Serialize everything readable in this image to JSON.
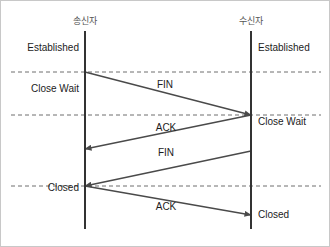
{
  "diagram": {
    "title_left": "송신자",
    "title_right": "수신자",
    "frame": {
      "width": 330,
      "height": 247,
      "background": "#ffffff",
      "border_color": "#c8c8c8"
    },
    "lifelines": [
      {
        "name": "sender",
        "label": "송신자",
        "x": 84,
        "top": 30,
        "bottom": 228,
        "color": "#333333"
      },
      {
        "name": "receiver",
        "label": "수신자",
        "x": 250,
        "top": 30,
        "bottom": 228,
        "color": "#333333"
      }
    ],
    "states": {
      "sender_established": "Established",
      "sender_close_wait": "Close Wait",
      "sender_closed": "Closed",
      "receiver_established": "Established",
      "receiver_close_wait": "Close Wait",
      "receiver_closed": "Closed"
    },
    "messages": [
      {
        "name": "fin-1",
        "label": "FIN",
        "direction": "left-to-right",
        "from_x": 84,
        "from_y": 71,
        "to_x": 250,
        "to_y": 114
      },
      {
        "name": "ack-1",
        "label": "ACK",
        "direction": "right-to-left",
        "from_x": 250,
        "from_y": 114,
        "to_x": 84,
        "to_y": 148
      },
      {
        "name": "fin-2",
        "label": "FIN",
        "direction": "right-to-left",
        "from_x": 250,
        "from_y": 150,
        "to_x": 84,
        "to_y": 185
      },
      {
        "name": "ack-2",
        "label": "ACK",
        "direction": "left-to-right",
        "from_x": 84,
        "from_y": 185,
        "to_x": 250,
        "to_y": 214
      }
    ],
    "dashed_lines": [
      {
        "name": "divider-1",
        "y": 71,
        "x1": 10,
        "x2": 320
      },
      {
        "name": "divider-2",
        "y": 114,
        "x1": 10,
        "x2": 320
      },
      {
        "name": "divider-3",
        "y": 185,
        "x1": 10,
        "x2": 320
      }
    ],
    "colors": {
      "line": "#333333",
      "arrow": "#4a4a4a",
      "dashed": "#6e6e6e",
      "text": "#1c1c1c",
      "title_text": "#555555"
    }
  }
}
